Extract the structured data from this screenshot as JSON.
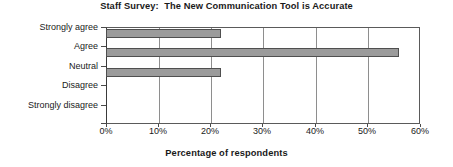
{
  "chart_data": {
    "type": "bar",
    "orientation": "horizontal",
    "title": "Staff Survey:  The New Communication Tool is Accurate",
    "xlabel": "Percentage of respondents",
    "ylabel": "",
    "categories": [
      "Strongly agree",
      "Agree",
      "Neutral",
      "Disagree",
      "Strongly disagree"
    ],
    "values": [
      22,
      56,
      22,
      0,
      0
    ],
    "xlim": [
      0,
      60
    ],
    "xticks": [
      0,
      10,
      20,
      30,
      40,
      50,
      60
    ],
    "xtick_labels": [
      "0%",
      "10%",
      "20%",
      "30%",
      "40%",
      "50%",
      "60%"
    ],
    "grid": "vertical",
    "legend": "none",
    "bar_color": "#9b9b9b",
    "bar_border_color": "#4f4f4f",
    "plot_border_color": "#5a5a5a",
    "background_color": "#ffffff",
    "text_color": "#1a1a1a"
  }
}
